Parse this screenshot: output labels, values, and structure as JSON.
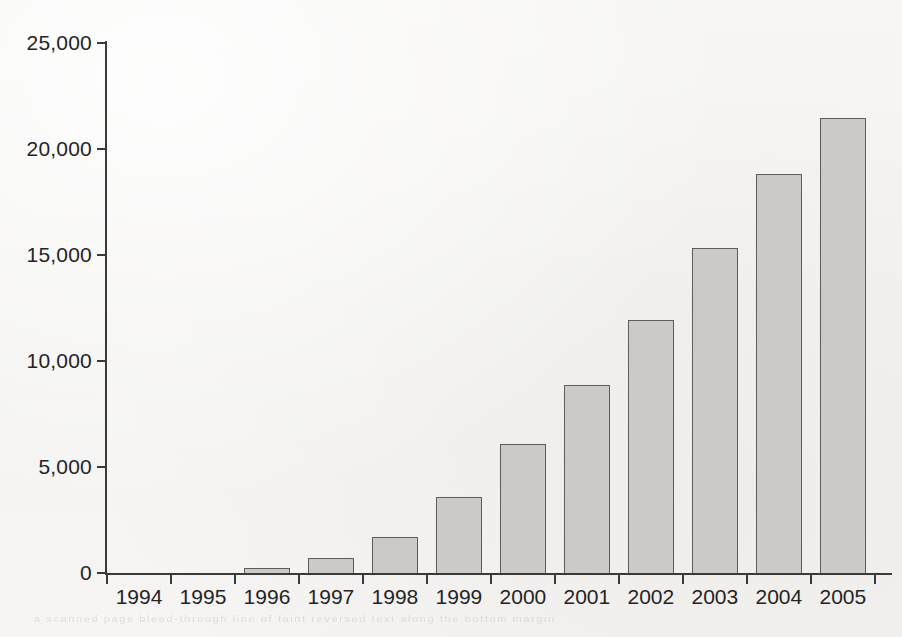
{
  "chart_data": {
    "type": "bar",
    "title": "",
    "subtitle": "",
    "xlabel": "",
    "ylabel": "",
    "categories": [
      "1994",
      "1995",
      "1996",
      "1997",
      "1998",
      "1999",
      "2000",
      "2001",
      "2002",
      "2003",
      "2004",
      "2005"
    ],
    "values": [
      0,
      0,
      240,
      700,
      1700,
      3600,
      6100,
      8850,
      11950,
      15350,
      18800,
      21450
    ],
    "series": [
      {
        "name": "",
        "values": [
          0,
          0,
          240,
          700,
          1700,
          3600,
          6100,
          8850,
          11950,
          15350,
          18800,
          21450
        ]
      }
    ],
    "ylim": [
      0,
      25000
    ],
    "ytick_values": [
      0,
      5000,
      10000,
      15000,
      20000,
      25000
    ],
    "ytick_labels": [
      "0",
      "5,000",
      "10,000",
      "15,000",
      "20,000",
      "25,000"
    ],
    "xtick_labels": [
      "1994",
      "1995",
      "1996",
      "1997",
      "1998",
      "1999",
      "2000",
      "2001",
      "2002",
      "2003",
      "2004",
      "2005"
    ],
    "grid": false,
    "legend": false,
    "legend_position": "none",
    "annotations": [],
    "bar_fill_color": "#cccac7",
    "bar_border_color": "#5c5c5c",
    "axis_color": "#3a3a3a",
    "text_color": "#242424",
    "background_color": "#f6f5f3"
  },
  "scan": {
    "bleed_text": "a scanned page bleed-through line of faint reversed text along the bottom margin"
  }
}
